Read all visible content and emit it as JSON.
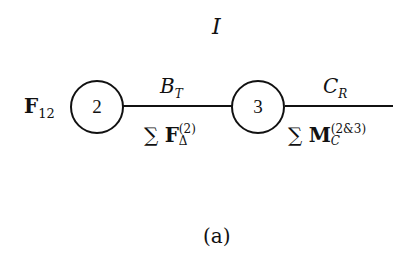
{
  "diagram": {
    "title": "I",
    "caption": "(a)",
    "nodes": [
      {
        "id": "2",
        "label": "2",
        "input_label": {
          "symbol": "F",
          "subscript": "12"
        }
      },
      {
        "id": "3",
        "label": "3"
      }
    ],
    "edges": [
      {
        "from": "2",
        "to": "3",
        "top_label": {
          "symbol": "B",
          "subscript": "T"
        },
        "bottom_label": {
          "sum": "∑",
          "symbol": "F",
          "superscript": "(2)",
          "subscript": "Δ"
        }
      },
      {
        "from": "3",
        "to": "output",
        "top_label": {
          "symbol": "C",
          "subscript": "R"
        },
        "bottom_label": {
          "sum": "∑",
          "symbol": "M",
          "superscript": "(2&3)",
          "subscript": "C"
        }
      }
    ]
  }
}
